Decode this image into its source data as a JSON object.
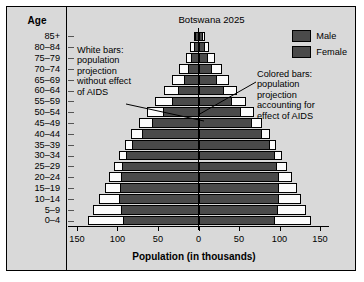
{
  "chart_data": {
    "type": "bar",
    "subtype": "population-pyramid",
    "title": "Botswana 2025",
    "xlabel": "Population (in thousands)",
    "ylabel": "Age",
    "xlim": [
      -150,
      150
    ],
    "xticks": [
      -150,
      -100,
      -50,
      0,
      50,
      100,
      150
    ],
    "xticklabels": [
      "150",
      "100",
      "50",
      "0",
      "50",
      "100",
      "150"
    ],
    "grid": false,
    "legend_position": "top-right",
    "categories": [
      "85+",
      "80–84",
      "75–79",
      "70–74",
      "65–69",
      "60–64",
      "55–59",
      "50–54",
      "45–49",
      "40–44",
      "35–39",
      "30–34",
      "25–29",
      "20–24",
      "15–19",
      "10–14",
      "5–9",
      "0–4"
    ],
    "series": [
      {
        "name": "Male without AIDS",
        "side": "left",
        "style": "white",
        "values": [
          6,
          10,
          16,
          24,
          33,
          43,
          54,
          64,
          74,
          83,
          91,
          98,
          104,
          110,
          116,
          123,
          130,
          136
        ]
      },
      {
        "name": "Female without AIDS",
        "side": "right",
        "style": "white",
        "values": [
          8,
          13,
          20,
          29,
          38,
          48,
          59,
          69,
          79,
          88,
          96,
          103,
          109,
          115,
          121,
          127,
          133,
          139
        ]
      },
      {
        "name": "Male with AIDS",
        "side": "left",
        "style": "colored",
        "values": [
          4,
          6,
          9,
          13,
          18,
          25,
          33,
          44,
          57,
          70,
          82,
          90,
          94,
          96,
          97,
          98,
          96,
          93
        ]
      },
      {
        "name": "Female with AIDS",
        "side": "right",
        "style": "colored",
        "values": [
          5,
          8,
          12,
          17,
          23,
          31,
          41,
          53,
          66,
          78,
          88,
          94,
          97,
          99,
          100,
          100,
          98,
          95
        ]
      }
    ],
    "annotations": [
      {
        "id": "left-note",
        "text": "White bars:\npopulation\nprojection\nwithout effect\nof AIDS"
      },
      {
        "id": "right-note",
        "text": "Colored bars:\npopulation\nprojection\naccounting for\neffect of AIDS"
      }
    ],
    "legend": [
      {
        "label": "Male",
        "color": "#4a4a4a"
      },
      {
        "label": "Female",
        "color": "#4a4a4a"
      }
    ],
    "colors": {
      "background": "#d9d9d9",
      "white_bar": "#fbfbfb",
      "colored_bar": "#4a4a4a",
      "axis": "#000000"
    }
  }
}
